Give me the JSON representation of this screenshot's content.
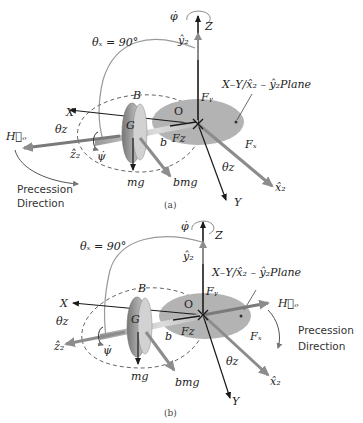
{
  "figure": {
    "panels": [
      {
        "id": "a",
        "caption": "(a)",
        "labels": {
          "phi_dot": "φ̇",
          "z_axis": "Z",
          "y2_hat": "ŷ₂",
          "theta_x": "θₓ = 90°",
          "plane": "X–Y/x̂₂ – ŷ₂Plane",
          "b_point": "B",
          "o_point": "O",
          "x_axis": "X",
          "f_y": "Fᵧ",
          "g_point": "G",
          "h_o": "H⃗ₒ",
          "theta_z_left": "θ𝑧",
          "f_z": "F𝑧",
          "b_dist": "b",
          "f_x": "Fₓ",
          "z2_hat": "ẑ₂",
          "psi_dot": "ψ̇",
          "theta_z_right": "θ𝑧",
          "mg": "mg",
          "bmg": "bmg",
          "x2_hat": "x̂₂",
          "y_axis": "Y",
          "precession_line1": "Precession",
          "precession_line2": "Direction"
        }
      },
      {
        "id": "b",
        "caption": "(b)",
        "labels": {
          "phi_dot": "φ̇",
          "z_axis": "Z",
          "y2_hat": "ŷ₂",
          "theta_x": "θₓ = 90°",
          "plane": "X–Y/x̂₂ – ŷ₂Plane",
          "b_point": "B",
          "o_point": "O",
          "x_axis": "X",
          "f_y": "Fᵧ",
          "g_point": "G",
          "h_o": "H⃗ₒ",
          "theta_z_left": "θ𝑧",
          "f_z": "F𝑧",
          "b_dist": "b",
          "f_x": "Fₓ",
          "z2_hat": "ẑ₂",
          "psi_dot": "ψ̇",
          "theta_z_right": "θ𝑧",
          "mg": "mg",
          "bmg": "bmg",
          "x2_hat": "x̂₂",
          "y_axis": "Y",
          "precession_line1": "Precession",
          "precession_line2": "Direction"
        }
      }
    ],
    "colors": {
      "plane_fill": "#b3b3b3",
      "axis_dark": "#1a1a1a",
      "vector_gray": "#8c8c8c",
      "disk_fill": "#8a8a8a",
      "arc_gray": "#999999"
    }
  }
}
